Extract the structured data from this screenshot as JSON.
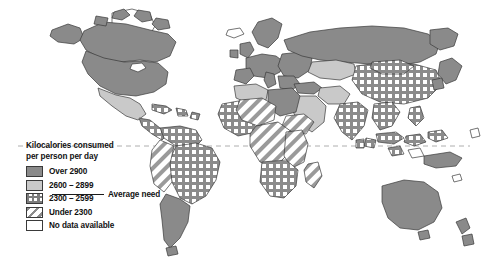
{
  "map": {
    "title_lines": "Kilocalories consumed\nper person per day",
    "average_need_label": "Average need",
    "legend": [
      {
        "label": "Over 2900",
        "swatch": "solid-dark-gray",
        "color": "#8a8a8a"
      },
      {
        "label": "2600 – 2899",
        "swatch": "solid-light-gray",
        "color": "#c9c9c9"
      },
      {
        "label": "2300 – 2599",
        "swatch": "grid-pattern",
        "color": "#7d7d7d"
      },
      {
        "label": "Under 2300",
        "swatch": "diagonal-hatch",
        "color": "#8c8c8c"
      },
      {
        "label": "No data available",
        "swatch": "empty-white",
        "color": "#ffffff"
      }
    ],
    "colors": {
      "outline": "#3a3a3a",
      "dark_gray": "#8a8a8a",
      "light_gray": "#c9c9c9",
      "no_data": "#ffffff",
      "equator": "#909090",
      "background": "#ffffff"
    },
    "equator_line": "dashed",
    "regions": [
      {
        "name": "Canada",
        "category": "Over 2900"
      },
      {
        "name": "United States",
        "category": "Over 2900"
      },
      {
        "name": "Greenland",
        "category": "No data available"
      },
      {
        "name": "Mexico",
        "category": "2600 – 2899"
      },
      {
        "name": "Central America",
        "category": "2300 – 2599"
      },
      {
        "name": "Caribbean",
        "category": "2300 – 2599"
      },
      {
        "name": "Brazil",
        "category": "2300 – 2599"
      },
      {
        "name": "Argentina",
        "category": "Over 2900"
      },
      {
        "name": "Chile",
        "category": "Over 2900"
      },
      {
        "name": "Peru / Bolivia",
        "category": "Under 2300"
      },
      {
        "name": "Western Europe",
        "category": "Over 2900"
      },
      {
        "name": "Eastern Europe",
        "category": "Over 2900"
      },
      {
        "name": "Russia",
        "category": "Over 2900"
      },
      {
        "name": "Turkey",
        "category": "Over 2900"
      },
      {
        "name": "North Africa",
        "category": "2600 – 2899"
      },
      {
        "name": "Libya / Egypt",
        "category": "Over 2900"
      },
      {
        "name": "Sahel",
        "category": "Under 2300"
      },
      {
        "name": "West Africa",
        "category": "2300 – 2599"
      },
      {
        "name": "Central Africa",
        "category": "Under 2300"
      },
      {
        "name": "East Africa",
        "category": "Under 2300"
      },
      {
        "name": "Southern Africa",
        "category": "2300 – 2599"
      },
      {
        "name": "Madagascar",
        "category": "Under 2300"
      },
      {
        "name": "Arabian Peninsula",
        "category": "2600 – 2899"
      },
      {
        "name": "Iran",
        "category": "2600 – 2899"
      },
      {
        "name": "India",
        "category": "2300 – 2599"
      },
      {
        "name": "China",
        "category": "2300 – 2599"
      },
      {
        "name": "Mongolia",
        "category": "2300 – 2599"
      },
      {
        "name": "Southeast Asia",
        "category": "2300 – 2599"
      },
      {
        "name": "Indonesia",
        "category": "2300 – 2599"
      },
      {
        "name": "Japan",
        "category": "Over 2900"
      },
      {
        "name": "Australia",
        "category": "Over 2900"
      },
      {
        "name": "New Zealand",
        "category": "Over 2900"
      }
    ]
  }
}
